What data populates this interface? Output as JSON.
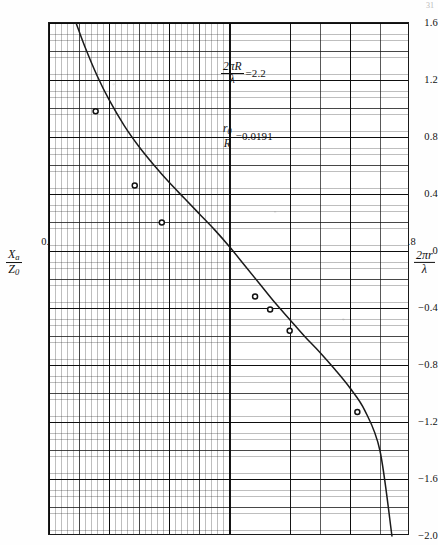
{
  "figure": {
    "page_number": "31",
    "y_axis": {
      "label_numerator": "X",
      "label_numerator_sub": "a",
      "label_denominator": "Z",
      "label_denominator_sub": "0",
      "ticks": [
        "1.6",
        "1.2",
        "0.8",
        "0.4",
        "0",
        "-0.4",
        "-0.8",
        "-1.2",
        "-1.6",
        "-2.0"
      ],
      "tick_values": [
        1.6,
        1.2,
        0.8,
        0.4,
        0,
        -0.4,
        -0.8,
        -1.2,
        -1.6,
        -2.0
      ]
    },
    "x_axis": {
      "label_numerator": "2πr",
      "label_denominator": "λ",
      "ticks": [
        "0.6",
        "0.8",
        "1.0",
        "1.2",
        "1.4",
        "1.6",
        "1.8"
      ],
      "tick_values": [
        0.6,
        0.8,
        1.0,
        1.2,
        1.4,
        1.6,
        1.8
      ]
    },
    "annotations": [
      {
        "id": "ka",
        "numerator": "2πR",
        "denominator": "λ",
        "equals": "=2.2",
        "value": 2.2
      },
      {
        "id": "r0R",
        "numerator": "r",
        "numerator_sub": "0",
        "denominator": "R",
        "equals": "=0.0191",
        "value": 0.0191
      }
    ],
    "ink_color": "#1a1a1a",
    "grid_color": "#2a2a2a",
    "paper_color": "#ffffff"
  },
  "chart_data": {
    "type": "line",
    "title": "",
    "subtitle": "",
    "xlabel": "2πr/λ",
    "ylabel": "X_a/Z_0",
    "xlim": [
      0.6,
      1.8
    ],
    "ylim": [
      -2.0,
      1.6
    ],
    "xticks": [
      0.6,
      0.8,
      1.0,
      1.2,
      1.4,
      1.6,
      1.8
    ],
    "yticks": [
      1.6,
      1.2,
      0.8,
      0.4,
      0,
      -0.4,
      -0.8,
      -1.2,
      -1.6,
      -2.0
    ],
    "grid": true,
    "grid_style": "log-style engineering graph paper, fine/minor/major rulings",
    "legend": null,
    "annotations": [
      "2πR/λ = 2.2",
      "r₀/R = 0.0191"
    ],
    "series": [
      {
        "name": "theoretical curve",
        "type": "line",
        "marker": "none",
        "x": [
          0.69,
          0.72,
          0.76,
          0.8,
          0.85,
          0.9,
          0.95,
          1.0,
          1.05,
          1.1,
          1.15,
          1.2,
          1.25,
          1.3,
          1.35,
          1.4,
          1.45,
          1.5,
          1.55,
          1.6,
          1.65,
          1.7,
          1.74
        ],
        "y": [
          1.6,
          1.43,
          1.23,
          1.06,
          0.88,
          0.73,
          0.6,
          0.48,
          0.37,
          0.26,
          0.15,
          0.03,
          -0.1,
          -0.23,
          -0.36,
          -0.48,
          -0.6,
          -0.71,
          -0.83,
          -0.96,
          -1.12,
          -1.4,
          -2.0
        ]
      },
      {
        "name": "measured points",
        "type": "scatter",
        "marker": "open-circle",
        "x": [
          0.755,
          0.885,
          0.975,
          1.285,
          1.335,
          1.4,
          1.625
        ],
        "y": [
          0.98,
          0.46,
          0.2,
          -0.32,
          -0.41,
          -0.56,
          -1.13
        ]
      }
    ]
  }
}
